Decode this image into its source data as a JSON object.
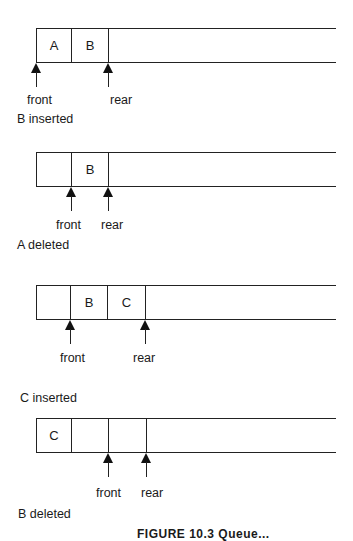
{
  "panels": [
    {
      "cells": [
        "A",
        "B"
      ],
      "cell_count_shown": 2,
      "front_index": 0,
      "rear_index": 2,
      "front_label": "front",
      "rear_label": "rear",
      "caption": "B inserted"
    },
    {
      "cells": [
        "",
        "B"
      ],
      "cell_count_shown": 2,
      "front_index": 1,
      "rear_index": 2,
      "front_label": "front",
      "rear_label": "rear",
      "caption": "A deleted"
    },
    {
      "cells": [
        "",
        "B",
        "C"
      ],
      "cell_count_shown": 3,
      "front_index": 1,
      "rear_index": 3,
      "front_label": "front",
      "rear_label": "rear",
      "caption": "C inserted"
    },
    {
      "cells": [
        "C",
        "",
        ""
      ],
      "cell_count_shown": 3,
      "front_index": 2,
      "rear_index": 3,
      "front_label": "front",
      "rear_label": "rear",
      "caption": "B deleted"
    }
  ],
  "figure_caption": "FIGURE 10.3  Queue...",
  "colors": {
    "line": "#222222",
    "text": "#1a1a1a",
    "background": "#ffffff"
  }
}
